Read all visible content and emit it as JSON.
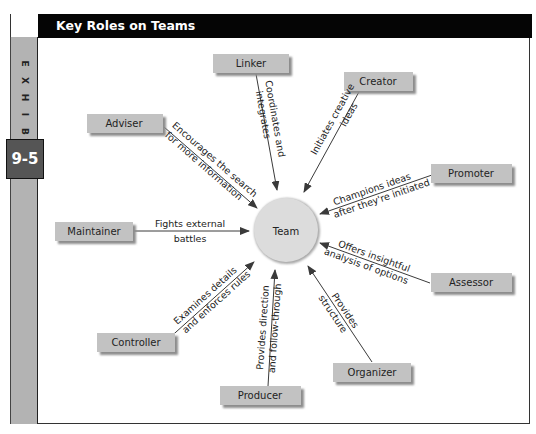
{
  "exhibit": {
    "label_letters": [
      "E",
      "X",
      "H",
      "I",
      "B",
      "I",
      "T"
    ],
    "number": "9-5",
    "title": "Key Roles on Teams"
  },
  "diagram": {
    "center": "Team",
    "roles": [
      {
        "name": "Linker",
        "description": [
          "Coordinates and",
          "integrates"
        ]
      },
      {
        "name": "Creator",
        "description": [
          "Initiates creative",
          "ideas"
        ]
      },
      {
        "name": "Promoter",
        "description": [
          "Champions ideas",
          "after they're initiated"
        ]
      },
      {
        "name": "Assessor",
        "description": [
          "Offers insightful",
          "analysis of options"
        ]
      },
      {
        "name": "Organizer",
        "description": [
          "Provides",
          "structure"
        ]
      },
      {
        "name": "Producer",
        "description": [
          "Provides direction",
          "and follow-through"
        ]
      },
      {
        "name": "Controller",
        "description": [
          "Examines details",
          "and enforces rules"
        ]
      },
      {
        "name": "Maintainer",
        "description": [
          "Fights external",
          "battles"
        ]
      },
      {
        "name": "Adviser",
        "description": [
          "Encourages the search",
          "for more information"
        ]
      }
    ]
  },
  "colors": {
    "header_bg": "#050505",
    "sidebar_bg": "#b3b3b3",
    "badge_bg": "#555555",
    "role_box": "#c2c2c2",
    "team_circle": "#dcdcdc"
  }
}
